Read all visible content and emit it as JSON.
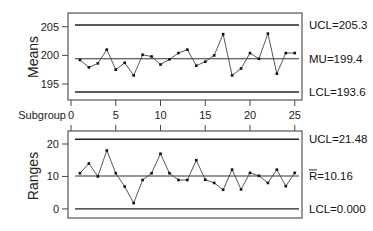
{
  "chart_data": [
    {
      "type": "line",
      "title": "",
      "ylabel": "Means",
      "xlabel": "Subgroup",
      "x": [
        1,
        2,
        3,
        4,
        5,
        6,
        7,
        8,
        9,
        10,
        11,
        12,
        13,
        14,
        15,
        16,
        17,
        18,
        19,
        20,
        21,
        22,
        23,
        24,
        25
      ],
      "values": [
        199.2,
        197.9,
        198.6,
        201.0,
        197.5,
        198.7,
        196.5,
        200.1,
        199.8,
        198.4,
        199.3,
        200.4,
        201.0,
        198.2,
        198.9,
        200.0,
        203.7,
        196.5,
        197.7,
        200.4,
        199.4,
        203.8,
        196.8,
        200.4,
        200.4
      ],
      "ylim": [
        192.2,
        207.4
      ],
      "yticks": [
        195,
        200,
        205
      ],
      "xticks": [
        0,
        5,
        10,
        15,
        20,
        25
      ],
      "control_limits": {
        "ucl": 205.3,
        "center": 199.4,
        "lcl": 193.6,
        "ucl_label": "UCL=205.3",
        "center_label": "MU=199.4",
        "lcl_label": "LCL=193.6"
      },
      "grid": false
    },
    {
      "type": "line",
      "title": "",
      "ylabel": "Ranges",
      "xlabel": "",
      "x": [
        1,
        2,
        3,
        4,
        5,
        6,
        7,
        8,
        9,
        10,
        11,
        12,
        13,
        14,
        15,
        16,
        17,
        18,
        19,
        20,
        21,
        22,
        23,
        24,
        25
      ],
      "values": [
        11.0,
        14.0,
        10.0,
        18.0,
        11.0,
        6.9,
        1.8,
        8.9,
        11.0,
        17.0,
        11.0,
        8.9,
        8.9,
        15.0,
        9.0,
        8.0,
        5.9,
        12.1,
        6.0,
        11.1,
        10.2,
        8.0,
        12.1,
        7.0,
        11.1
      ],
      "ylim": [
        -2.8,
        24.0
      ],
      "yticks": [
        0,
        10,
        20
      ],
      "control_limits": {
        "ucl": 21.48,
        "center": 10.16,
        "lcl": 0.0,
        "ucl_label": "UCL=21.48",
        "center_label": "R=10.16",
        "center_bar": "R",
        "lcl_label": "LCL=0.000"
      },
      "grid": false
    }
  ],
  "labels": {
    "subgroup_axis": "Subgroup"
  }
}
